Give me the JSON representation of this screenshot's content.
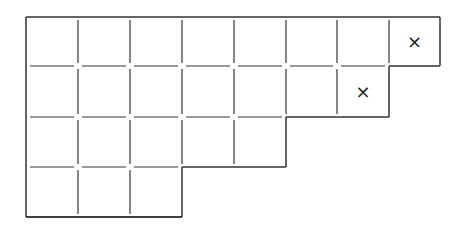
{
  "diagram": {
    "type": "young-diagram",
    "row_lengths": [
      8,
      7,
      5,
      3
    ],
    "marked_cells": [
      {
        "row": 0,
        "col": 7,
        "symbol": "×"
      },
      {
        "row": 1,
        "col": 6,
        "symbol": "×"
      }
    ],
    "colors": {
      "line": "#333333",
      "background": "#ffffff"
    }
  }
}
